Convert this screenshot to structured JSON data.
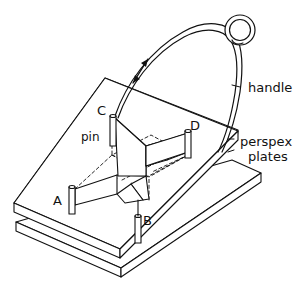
{
  "figure": {
    "type": "technical-line-drawing",
    "background_color": "#ffffff",
    "line_color": "#111111",
    "width": 306,
    "height": 295
  },
  "labels": {
    "handle": "handle",
    "perspex_line1": "perspex",
    "perspex_line2": "plates",
    "pin": "pin",
    "point_a": "A",
    "point_b": "B",
    "point_c": "C",
    "point_d": "D"
  },
  "parts": {
    "top_plate": "top-perspex-plate",
    "bottom_plate": "bottom-perspex-plate",
    "handle_loop": "handle-eyelet-loop",
    "handle_wire": "handle-wire",
    "motion_arrow": "double-headed-motion-arrow",
    "pins": [
      "pin-a",
      "pin-b",
      "pin-c",
      "pin-d"
    ],
    "film_bands": "soap-film-bands",
    "hidden_edges": "dashed-hidden-edges"
  }
}
